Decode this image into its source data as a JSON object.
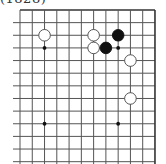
{
  "caption": "(1828)",
  "board": {
    "origin_x": 20,
    "origin_y": 10,
    "dx": 12.27,
    "dy": 12.64,
    "cols": 12,
    "rows": 13,
    "line_extend_left": 7,
    "line_extend_bottom": 1,
    "borders": [
      "top",
      "right"
    ],
    "line_color": "#555555",
    "border_color": "#333333",
    "stone_radius": 5.8,
    "star_points": [
      [
        2,
        3
      ],
      [
        8,
        3
      ],
      [
        2,
        9
      ],
      [
        8,
        9
      ]
    ],
    "stones": [
      {
        "color": "white",
        "col": 2,
        "row": 2
      },
      {
        "color": "white",
        "col": 6,
        "row": 2
      },
      {
        "color": "white",
        "col": 6,
        "row": 3
      },
      {
        "color": "black",
        "col": 7,
        "row": 3
      },
      {
        "color": "black",
        "col": 8,
        "row": 2
      },
      {
        "color": "white",
        "col": 9,
        "row": 4
      },
      {
        "color": "white",
        "col": 9,
        "row": 7
      }
    ]
  }
}
